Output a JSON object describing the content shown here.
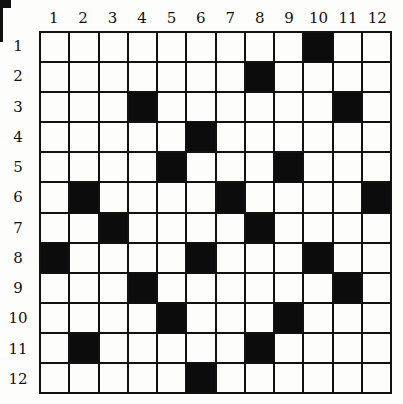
{
  "puzzle": {
    "rows": 12,
    "cols": 12,
    "column_labels": [
      "1",
      "2",
      "3",
      "4",
      "5",
      "6",
      "7",
      "8",
      "9",
      "10",
      "11",
      "12"
    ],
    "row_labels": [
      "1",
      "2",
      "3",
      "4",
      "5",
      "6",
      "7",
      "8",
      "9",
      "10",
      "11",
      "12"
    ],
    "black_cells": [
      [
        1,
        10
      ],
      [
        2,
        8
      ],
      [
        3,
        4
      ],
      [
        3,
        11
      ],
      [
        4,
        6
      ],
      [
        5,
        5
      ],
      [
        5,
        9
      ],
      [
        6,
        2
      ],
      [
        6,
        7
      ],
      [
        6,
        12
      ],
      [
        7,
        3
      ],
      [
        7,
        8
      ],
      [
        8,
        1
      ],
      [
        8,
        6
      ],
      [
        8,
        10
      ],
      [
        9,
        4
      ],
      [
        9,
        11
      ],
      [
        10,
        5
      ],
      [
        10,
        9
      ],
      [
        11,
        2
      ],
      [
        11,
        8
      ],
      [
        12,
        6
      ]
    ],
    "colors": {
      "black": "#0c0c0c",
      "white": "#fdfdfb",
      "line": "#111111"
    }
  }
}
